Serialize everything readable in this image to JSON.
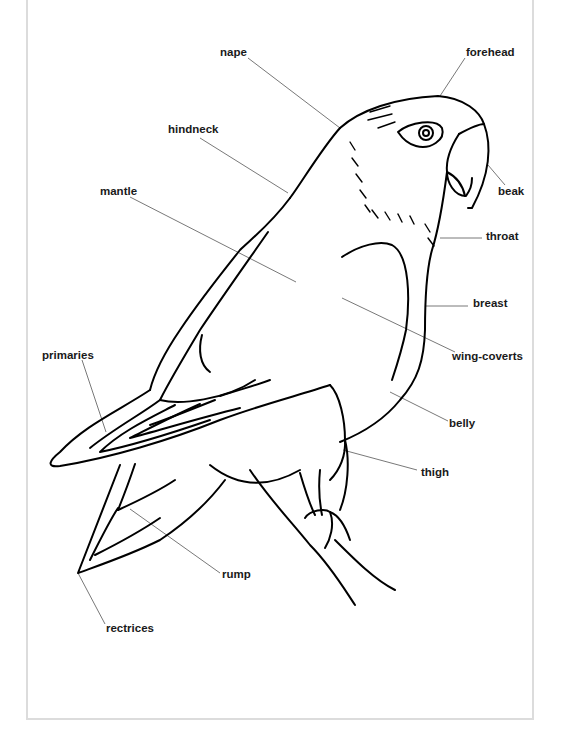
{
  "diagram": {
    "labels": [
      {
        "id": "nape",
        "text": "nape",
        "x": 220,
        "y": 47
      },
      {
        "id": "forehead",
        "text": "forehead",
        "x": 466,
        "y": 47
      },
      {
        "id": "hindneck",
        "text": "hindneck",
        "x": 168,
        "y": 124
      },
      {
        "id": "mantle",
        "text": "mantle",
        "x": 100,
        "y": 186
      },
      {
        "id": "beak",
        "text": "beak",
        "x": 498,
        "y": 186
      },
      {
        "id": "throat",
        "text": "throat",
        "x": 486,
        "y": 231
      },
      {
        "id": "breast",
        "text": "breast",
        "x": 473,
        "y": 298
      },
      {
        "id": "primaries",
        "text": "primaries",
        "x": 42,
        "y": 350
      },
      {
        "id": "wing-coverts",
        "text": "wing-coverts",
        "x": 452,
        "y": 351
      },
      {
        "id": "belly",
        "text": "belly",
        "x": 449,
        "y": 418
      },
      {
        "id": "thigh",
        "text": "thigh",
        "x": 421,
        "y": 467
      },
      {
        "id": "rump",
        "text": "rump",
        "x": 222,
        "y": 569
      },
      {
        "id": "rectrices",
        "text": "rectrices",
        "x": 106,
        "y": 623
      }
    ]
  }
}
